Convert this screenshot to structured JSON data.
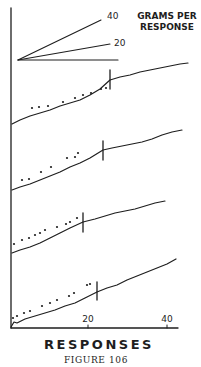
{
  "figure": {
    "caption": "Figure 106",
    "caption_display": "FIGURE 106"
  },
  "chart_data": {
    "type": "line",
    "title": "",
    "xlabel": "RESPONSES",
    "ylabel": "",
    "x_ticks": [
      20,
      40
    ],
    "x_tick_labels": [
      "20",
      "40"
    ],
    "xlim": [
      0,
      43
    ],
    "grid": false,
    "legend": {
      "title": "GRAMS PER RESPONSE",
      "title_lines": [
        "GRAMS PER",
        "RESPONSE"
      ],
      "position": "top",
      "slope_lines": [
        {
          "label": "40",
          "grams_per_response": 40
        },
        {
          "label": "20",
          "grams_per_response": 20
        },
        {
          "label": "",
          "grams_per_response": 0
        }
      ]
    },
    "annotation": "Vertical hash mark on each record marks a change point; dots above each curve precede the mark.",
    "series": [
      {
        "name": "Record 1 (top)",
        "change_mark_response": 25,
        "curve_px": [
          [
            12,
            124
          ],
          [
            20,
            120
          ],
          [
            30,
            116
          ],
          [
            40,
            113
          ],
          [
            50,
            110
          ],
          [
            60,
            106
          ],
          [
            70,
            103
          ],
          [
            80,
            100
          ],
          [
            90,
            95
          ],
          [
            100,
            89
          ],
          [
            110,
            80
          ],
          [
            120,
            77
          ],
          [
            130,
            75
          ],
          [
            140,
            72
          ],
          [
            150,
            70
          ],
          [
            160,
            68
          ],
          [
            170,
            66
          ],
          [
            180,
            64
          ],
          [
            188,
            63
          ]
        ],
        "mark_px": {
          "x": 110,
          "y1": 70,
          "y2": 89
        },
        "dots_px": [
          [
            32,
            108
          ],
          [
            39,
            107
          ],
          [
            48,
            106
          ],
          [
            63,
            102
          ],
          [
            75,
            98
          ],
          [
            83,
            95
          ],
          [
            91,
            93
          ],
          [
            101,
            89
          ],
          [
            106,
            88
          ]
        ]
      },
      {
        "name": "Record 2",
        "change_mark_response": 24,
        "curve_px": [
          [
            12,
            190
          ],
          [
            20,
            187
          ],
          [
            30,
            184
          ],
          [
            40,
            180
          ],
          [
            50,
            176
          ],
          [
            60,
            172
          ],
          [
            70,
            167
          ],
          [
            80,
            163
          ],
          [
            90,
            158
          ],
          [
            103,
            150
          ],
          [
            112,
            148
          ],
          [
            122,
            146
          ],
          [
            132,
            144
          ],
          [
            142,
            142
          ],
          [
            152,
            139
          ],
          [
            162,
            135
          ],
          [
            172,
            132
          ],
          [
            182,
            130
          ]
        ],
        "mark_px": {
          "x": 103,
          "y1": 141,
          "y2": 160
        },
        "dots_px": [
          [
            22,
            180
          ],
          [
            29,
            179
          ],
          [
            41,
            172
          ],
          [
            51,
            167
          ],
          [
            67,
            158
          ],
          [
            75,
            157
          ],
          [
            78,
            153
          ]
        ]
      },
      {
        "name": "Record 3",
        "change_mark_response": 19,
        "curve_px": [
          [
            12,
            253
          ],
          [
            20,
            250
          ],
          [
            30,
            247
          ],
          [
            40,
            243
          ],
          [
            50,
            238
          ],
          [
            60,
            233
          ],
          [
            70,
            228
          ],
          [
            83,
            222
          ],
          [
            95,
            219
          ],
          [
            105,
            216
          ],
          [
            115,
            213
          ],
          [
            125,
            211
          ],
          [
            135,
            209
          ],
          [
            145,
            206
          ],
          [
            155,
            203
          ],
          [
            165,
            201
          ]
        ],
        "mark_px": {
          "x": 83,
          "y1": 213,
          "y2": 232
        },
        "dots_px": [
          [
            14,
            244
          ],
          [
            22,
            240
          ],
          [
            29,
            238
          ],
          [
            35,
            235
          ],
          [
            40,
            233
          ],
          [
            45,
            230
          ],
          [
            57,
            227
          ],
          [
            66,
            224
          ],
          [
            70,
            222
          ],
          [
            77,
            218
          ]
        ]
      },
      {
        "name": "Record 4 (bottom)",
        "change_mark_response": 22,
        "curve_px": [
          [
            11,
            327
          ],
          [
            14,
            322
          ],
          [
            17,
            323
          ],
          [
            25,
            319
          ],
          [
            35,
            316
          ],
          [
            45,
            313
          ],
          [
            55,
            310
          ],
          [
            65,
            306
          ],
          [
            75,
            303
          ],
          [
            85,
            298
          ],
          [
            97,
            292
          ],
          [
            107,
            288
          ],
          [
            117,
            285
          ],
          [
            127,
            280
          ],
          [
            137,
            276
          ],
          [
            147,
            272
          ],
          [
            157,
            268
          ],
          [
            167,
            264
          ],
          [
            176,
            259
          ]
        ],
        "mark_px": {
          "x": 97,
          "y1": 282,
          "y2": 300
        },
        "dots_px": [
          [
            13,
            318
          ],
          [
            17,
            316
          ],
          [
            24,
            313
          ],
          [
            30,
            311
          ],
          [
            42,
            306
          ],
          [
            50,
            303
          ],
          [
            57,
            300
          ],
          [
            69,
            296
          ],
          [
            74,
            293
          ],
          [
            87,
            285
          ],
          [
            90,
            284
          ]
        ]
      }
    ]
  },
  "layout_px": {
    "y_axis": {
      "x": 11,
      "y1": 8,
      "y2": 328
    },
    "x_axis": {
      "y": 328,
      "x1": 11,
      "x2": 178
    },
    "x_tick_px": [
      88,
      167
    ],
    "fan_origin": [
      18,
      60
    ],
    "fan_ends": [
      [
        101,
        20
      ],
      [
        110,
        44
      ],
      [
        118,
        60
      ]
    ],
    "fan_label_px": [
      [
        107,
        19
      ],
      [
        114,
        46
      ]
    ]
  }
}
